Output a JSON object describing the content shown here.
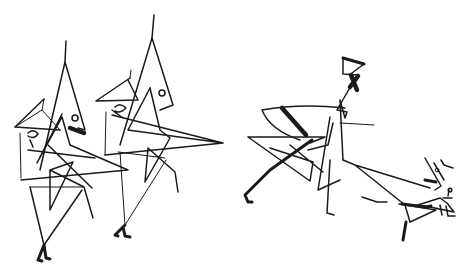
{
  "artwork": {
    "kind": "line drawing",
    "background": "#ffffff",
    "ink": "#1a1a1a",
    "figures": [
      {
        "name": "left-marching-figure"
      },
      {
        "name": "middle-marching-figure"
      },
      {
        "name": "running-figure-with-fan"
      },
      {
        "name": "small-bird-figure"
      }
    ]
  }
}
